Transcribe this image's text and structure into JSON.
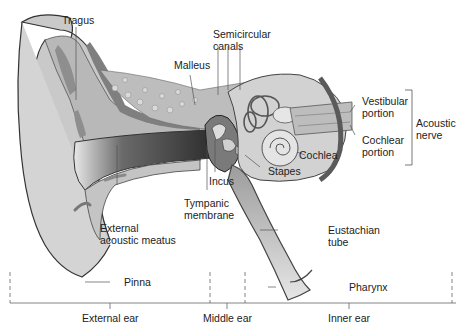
{
  "diagram": {
    "style": "grayscale illustration",
    "labels": {
      "tragus": "Tragus",
      "semicircular_canals": [
        "Semicircular",
        "canals"
      ],
      "malleus": "Malleus",
      "vestibular_portion": [
        "Vestibular",
        "portion"
      ],
      "cochlear_portion": [
        "Cochlear",
        "portion"
      ],
      "acoustic_nerve": [
        "Acoustic",
        "nerve"
      ],
      "cochlea": "Cochlea",
      "stapes": "Stapes",
      "incus": "Incus",
      "tympanic_membrane": [
        "Tympanic",
        "membrane"
      ],
      "external_acoustic_meatus": [
        "External",
        "acoustic meatus"
      ],
      "eustachian_tube": [
        "Eustachian",
        "tube"
      ],
      "pinna": "Pinna",
      "pharynx": "Pharynx"
    },
    "regions": {
      "external_ear": "External ear",
      "middle_ear": "Middle ear",
      "inner_ear": "Inner ear"
    },
    "colors": {
      "background": "#ffffff",
      "skin_light": "#d6d6d6",
      "skin_mid": "#b9b9b9",
      "cartilage": "#9a9a9a",
      "canal_dark": "#3a3a3a",
      "outline": "#333333",
      "label_text": "#222222",
      "leader_line": "#555555"
    }
  }
}
